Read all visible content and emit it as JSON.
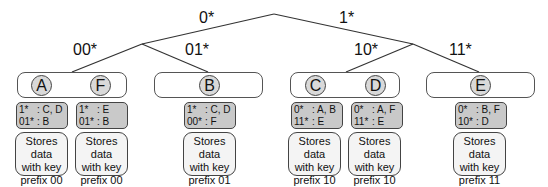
{
  "diagram": {
    "type": "prefix-tree",
    "edge_labels": {
      "root_left": "0*",
      "root_right": "1*",
      "l00": "00*",
      "l01": "01*",
      "l10": "10*",
      "l11": "11*"
    },
    "groups": [
      {
        "prefix": "00",
        "nodes": [
          "A",
          "F"
        ]
      },
      {
        "prefix": "01",
        "nodes": [
          "B"
        ]
      },
      {
        "prefix": "10",
        "nodes": [
          "C",
          "D"
        ]
      },
      {
        "prefix": "11",
        "nodes": [
          "E"
        ]
      }
    ],
    "nodes": {
      "A": {
        "label": "A",
        "table": [
          {
            "key": "1*",
            "val": ": C, D"
          },
          {
            "key": "01*",
            "val": ": B"
          }
        ],
        "store": [
          "Stores data",
          "with key",
          "prefix 00"
        ]
      },
      "F": {
        "label": "F",
        "table": [
          {
            "key": "1*",
            "val": ": E"
          },
          {
            "key": "01*",
            "val": ": B"
          }
        ],
        "store": [
          "Stores data",
          "with key",
          "prefix 00"
        ]
      },
      "B": {
        "label": "B",
        "table": [
          {
            "key": "1*",
            "val": ": C, D"
          },
          {
            "key": "00*",
            "val": ": F"
          }
        ],
        "store": [
          "Stores data",
          "with key",
          "prefix 01"
        ]
      },
      "C": {
        "label": "C",
        "table": [
          {
            "key": "0*",
            "val": ": A, B"
          },
          {
            "key": "11*",
            "val": ": E"
          }
        ],
        "store": [
          "Stores data",
          "with key",
          "prefix 10"
        ]
      },
      "D": {
        "label": "D",
        "table": [
          {
            "key": "0*",
            "val": ": A, F"
          },
          {
            "key": "11*",
            "val": ": E"
          }
        ],
        "store": [
          "Stores data",
          "with key",
          "prefix 10"
        ]
      },
      "E": {
        "label": "E",
        "table": [
          {
            "key": "0*",
            "val": ": B, F"
          },
          {
            "key": "10*",
            "val": ": D"
          }
        ],
        "store": [
          "Stores data",
          "with key",
          "prefix 11"
        ]
      }
    },
    "colors": {
      "node_fill": "#d9d9d9",
      "table_fill": "#c9c9c9",
      "store_fill": "#f4f4f4",
      "line": "#333333"
    }
  }
}
